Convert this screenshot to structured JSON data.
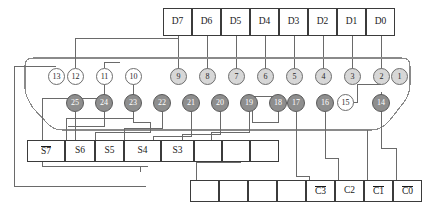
{
  "diagram": {
    "colors": {
      "outline": "#3b3b3b",
      "wire": "#6a6a6a",
      "shell": "#8a8a8a",
      "pin_top_fill": "#d7d7d7",
      "pin_bottom_fill": "#8e8e8e",
      "pin_empty_fill": "#ffffff",
      "text": "#1a1a1a"
    },
    "data_row": {
      "name": "data-signal-row",
      "cells": [
        {
          "label": "D7",
          "overbar": false
        },
        {
          "label": "D6",
          "overbar": false
        },
        {
          "label": "D5",
          "overbar": false
        },
        {
          "label": "D4",
          "overbar": false
        },
        {
          "label": "D3",
          "overbar": false
        },
        {
          "label": "D2",
          "overbar": false
        },
        {
          "label": "D1",
          "overbar": false
        },
        {
          "label": "D0",
          "overbar": false
        }
      ]
    },
    "status_row": {
      "name": "status-signal-row",
      "cells": [
        {
          "label": "S7",
          "overbar": true
        },
        {
          "label": "S6",
          "overbar": false
        },
        {
          "label": "S5",
          "overbar": false
        },
        {
          "label": "S4",
          "overbar": false
        },
        {
          "label": "S3",
          "overbar": false
        },
        {
          "label": "",
          "overbar": false
        },
        {
          "label": "",
          "overbar": false
        },
        {
          "label": "",
          "overbar": false
        }
      ]
    },
    "control_row": {
      "name": "control-signal-row",
      "cells": [
        {
          "label": "",
          "overbar": false
        },
        {
          "label": "",
          "overbar": false
        },
        {
          "label": "",
          "overbar": false
        },
        {
          "label": "",
          "overbar": false
        },
        {
          "label": "C3",
          "overbar": true
        },
        {
          "label": "C2",
          "overbar": false
        },
        {
          "label": "C1",
          "overbar": true
        },
        {
          "label": "C0",
          "overbar": true
        }
      ]
    },
    "pins_top": [
      {
        "label": "13",
        "filled": false
      },
      {
        "label": "12",
        "filled": false
      },
      {
        "label": "11",
        "filled": false
      },
      {
        "label": "10",
        "filled": false
      },
      {
        "label": "9",
        "filled": true
      },
      {
        "label": "8",
        "filled": true
      },
      {
        "label": "7",
        "filled": true
      },
      {
        "label": "6",
        "filled": true
      },
      {
        "label": "5",
        "filled": true
      },
      {
        "label": "4",
        "filled": true
      },
      {
        "label": "3",
        "filled": true
      },
      {
        "label": "2",
        "filled": true
      },
      {
        "label": "1",
        "filled": true
      }
    ],
    "pins_bottom": [
      {
        "label": "25",
        "filled": true
      },
      {
        "label": "24",
        "filled": true
      },
      {
        "label": "23",
        "filled": true
      },
      {
        "label": "22",
        "filled": true
      },
      {
        "label": "21",
        "filled": true
      },
      {
        "label": "20",
        "filled": true
      },
      {
        "label": "19",
        "filled": true
      },
      {
        "label": "18",
        "filled": true
      },
      {
        "label": "17",
        "filled": true
      },
      {
        "label": "16",
        "filled": true
      },
      {
        "label": "15",
        "filled": false
      },
      {
        "label": "14",
        "filled": true
      }
    ]
  }
}
